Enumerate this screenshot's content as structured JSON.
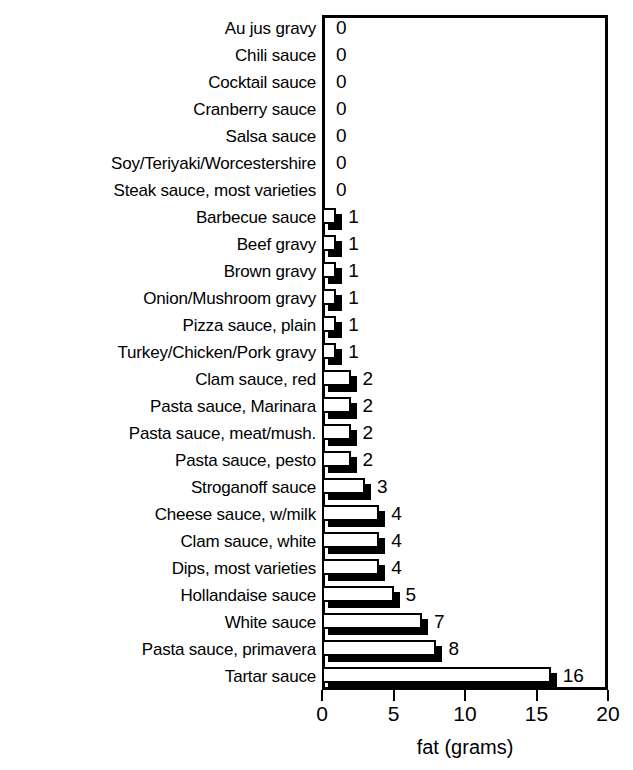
{
  "chart_data": {
    "type": "bar",
    "orientation": "horizontal",
    "title": "",
    "xlabel": "fat (grams)",
    "ylabel": "",
    "xlim": [
      0,
      20
    ],
    "xticks": [
      0,
      5,
      10,
      15,
      20
    ],
    "xtick_labels": [
      "0",
      "5",
      "10",
      "15",
      "20"
    ],
    "grid": false,
    "legend": null,
    "value_labels": true,
    "categories": [
      "Au jus gravy",
      "Chili sauce",
      "Cocktail sauce",
      "Cranberry sauce",
      "Salsa sauce",
      "Soy/Teriyaki/Worcestershire",
      "Steak sauce, most varieties",
      "Barbecue sauce",
      "Beef gravy",
      "Brown gravy",
      "Onion/Mushroom gravy",
      "Pizza sauce, plain",
      "Turkey/Chicken/Pork gravy",
      "Clam sauce, red",
      "Pasta sauce, Marinara",
      "Pasta sauce, meat/mush.",
      "Pasta sauce, pesto",
      "Stroganoff sauce",
      "Cheese sauce, w/milk",
      "Clam sauce, white",
      "Dips, most varieties",
      "Hollandaise sauce",
      "White sauce",
      "Pasta sauce, primavera",
      "Tartar sauce"
    ],
    "values": [
      0,
      0,
      0,
      0,
      0,
      0,
      0,
      1,
      1,
      1,
      1,
      1,
      1,
      2,
      2,
      2,
      2,
      3,
      4,
      4,
      4,
      5,
      7,
      8,
      16
    ],
    "value_label_texts": [
      "0",
      "0",
      "0",
      "0",
      "0",
      "0",
      "0",
      "1",
      "1",
      "1",
      "1",
      "1",
      "1",
      "2",
      "2",
      "2",
      "2",
      "3",
      "4",
      "4",
      "4",
      "5",
      "7",
      "8",
      "16"
    ],
    "colors": {
      "bar_face": "#ffffff",
      "bar_outline": "#000000",
      "bar_shadow": "#000000",
      "axis": "#000000",
      "text": "#000000",
      "background": "#ffffff"
    }
  }
}
